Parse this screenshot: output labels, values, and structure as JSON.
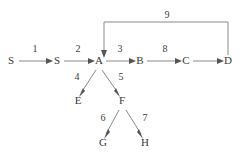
{
  "diagram": {
    "type": "directed-graph",
    "title": "",
    "background_color": "#ffffff",
    "line_color": "#8a8a8a",
    "text_color": "#3a3a3a",
    "nodes": [
      {
        "id": "S1",
        "label": "S",
        "x": 11,
        "y": 64
      },
      {
        "id": "S2",
        "label": "S",
        "x": 57,
        "y": 64
      },
      {
        "id": "A",
        "label": "A",
        "x": 99,
        "y": 64
      },
      {
        "id": "B",
        "label": "B",
        "x": 140,
        "y": 64
      },
      {
        "id": "C",
        "label": "C",
        "x": 186,
        "y": 64
      },
      {
        "id": "D",
        "label": "D",
        "x": 228,
        "y": 64
      },
      {
        "id": "E",
        "label": "E",
        "x": 78,
        "y": 104
      },
      {
        "id": "F",
        "label": "F",
        "x": 122,
        "y": 104
      },
      {
        "id": "G",
        "label": "G",
        "x": 103,
        "y": 146
      },
      {
        "id": "H",
        "label": "H",
        "x": 145,
        "y": 146
      }
    ],
    "edges": [
      {
        "id": "e1",
        "from": "S1",
        "to": "S2",
        "label": "1",
        "label_x": 35,
        "label_y": 52
      },
      {
        "id": "e2",
        "from": "S2",
        "to": "A",
        "label": "2",
        "label_x": 78,
        "label_y": 52
      },
      {
        "id": "e3",
        "from": "A",
        "to": "B",
        "label": "3",
        "label_x": 120,
        "label_y": 52
      },
      {
        "id": "e4",
        "from": "A",
        "to": "E",
        "label": "4",
        "label_x": 77,
        "label_y": 80
      },
      {
        "id": "e5",
        "from": "A",
        "to": "F",
        "label": "5",
        "label_x": 121,
        "label_y": 80
      },
      {
        "id": "e6",
        "from": "F",
        "to": "G",
        "label": "6",
        "label_x": 103,
        "label_y": 121
      },
      {
        "id": "e7",
        "from": "F",
        "to": "H",
        "label": "7",
        "label_x": 145,
        "label_y": 121
      },
      {
        "id": "e8",
        "from": "B",
        "to": "C",
        "label": "8",
        "label_x": 165,
        "label_y": 52
      },
      {
        "id": "e9",
        "from": "C",
        "to": "D",
        "label": "",
        "label_x": 0,
        "label_y": 0
      },
      {
        "id": "e10",
        "from": "D",
        "to": "A",
        "label": "9",
        "label_x": 167,
        "label_y": 18
      }
    ]
  }
}
